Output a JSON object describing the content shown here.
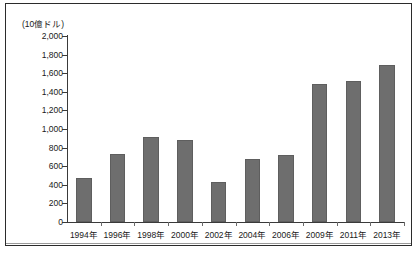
{
  "figure": {
    "unit_label": "(10億ドル)"
  },
  "chart_data": {
    "type": "bar",
    "title": "",
    "xlabel": "",
    "ylabel": "(10億ドル)",
    "categories": [
      "1994年",
      "1996年",
      "1998年",
      "2000年",
      "2002年",
      "2004年",
      "2006年",
      "2009年",
      "2011年",
      "2013年"
    ],
    "values": [
      470,
      730,
      910,
      880,
      430,
      680,
      720,
      1480,
      1520,
      1690
    ],
    "ylim": [
      0,
      2000
    ],
    "ytick_labels": [
      "2,000",
      "1,800",
      "1,600",
      "1,400",
      "1,200",
      "1,000",
      "800",
      "600",
      "400",
      "200",
      "0"
    ],
    "ytick_values": [
      2000,
      1800,
      1600,
      1400,
      1200,
      1000,
      800,
      600,
      400,
      200,
      0
    ],
    "grid": false,
    "legend": "none",
    "bar_color": "#6e6e6e",
    "axis_color": "#3a3a3a",
    "frame_color": "#2b2b2b"
  }
}
